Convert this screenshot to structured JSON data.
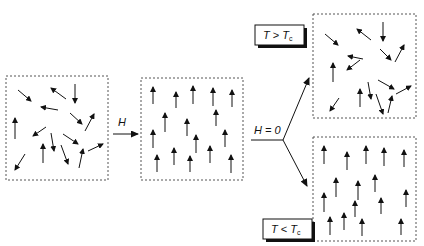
{
  "colors": {
    "ink": "#111111",
    "box_border": "#555555",
    "shadow": "#111111",
    "background": "#ffffff"
  },
  "labels": {
    "field_applied": "H",
    "field_removed": "H = 0",
    "high_temp": {
      "T": "T",
      "op": ">",
      "Tc": "T",
      "sub": "c"
    },
    "low_temp": {
      "T": "T",
      "op": "<",
      "Tc": "T",
      "sub": "c"
    }
  },
  "panels": [
    {
      "id": "random-initial",
      "state": "random",
      "box": [
        6,
        76,
        102,
        104
      ],
      "arrows": [
        [
          18,
          90,
          31,
          101
        ],
        [
          66,
          99,
          51,
          88
        ],
        [
          75,
          84,
          75,
          103
        ],
        [
          58,
          110,
          41,
          107
        ],
        [
          70,
          113,
          82,
          124
        ],
        [
          85,
          131,
          94,
          114
        ],
        [
          15,
          139,
          15,
          118
        ],
        [
          46,
          127,
          33,
          136
        ],
        [
          51,
          133,
          54,
          151
        ],
        [
          63,
          134,
          78,
          144
        ],
        [
          88,
          151,
          103,
          144
        ],
        [
          25,
          154,
          15,
          170
        ],
        [
          43,
          163,
          43,
          144
        ],
        [
          61,
          145,
          68,
          164
        ],
        [
          79,
          168,
          83,
          149
        ]
      ]
    },
    {
      "id": "aligned-field",
      "state": "aligned",
      "box": [
        141,
        78,
        102,
        102
      ],
      "arrows": [
        [
          153,
          104,
          153,
          87
        ],
        [
          176,
          108,
          176,
          92
        ],
        [
          193,
          104,
          193,
          86
        ],
        [
          213,
          106,
          213,
          88
        ],
        [
          232,
          107,
          232,
          90
        ],
        [
          165,
          132,
          165,
          113
        ],
        [
          216,
          126,
          216,
          110
        ],
        [
          187,
          136,
          187,
          119
        ],
        [
          153,
          148,
          153,
          130
        ],
        [
          196,
          153,
          196,
          135
        ],
        [
          225,
          147,
          225,
          130
        ],
        [
          174,
          165,
          174,
          148
        ],
        [
          157,
          172,
          157,
          155
        ],
        [
          190,
          172,
          190,
          156
        ],
        [
          210,
          163,
          210,
          146
        ],
        [
          231,
          173,
          231,
          155
        ]
      ]
    },
    {
      "id": "random-high-temp",
      "state": "random",
      "box": [
        313,
        14,
        103,
        104
      ],
      "arrows": [
        [
          325,
          34,
          338,
          45
        ],
        [
          371,
          40,
          357,
          29
        ],
        [
          383,
          22,
          383,
          41
        ],
        [
          363,
          59,
          348,
          56
        ],
        [
          380,
          49,
          391,
          60
        ],
        [
          395,
          62,
          404,
          45
        ],
        [
          333,
          82,
          333,
          63
        ],
        [
          360,
          60,
          347,
          70
        ],
        [
          368,
          82,
          371,
          99
        ],
        [
          378,
          80,
          394,
          89
        ],
        [
          396,
          94,
          411,
          86
        ],
        [
          339,
          98,
          330,
          111
        ],
        [
          360,
          107,
          360,
          89
        ],
        [
          376,
          94,
          383,
          114
        ],
        [
          388,
          113,
          392,
          96
        ]
      ]
    },
    {
      "id": "aligned-low-temp",
      "state": "aligned",
      "box": [
        313,
        137,
        103,
        104
      ],
      "arrows": [
        [
          324,
          164,
          324,
          146
        ],
        [
          347,
          170,
          347,
          152
        ],
        [
          366,
          164,
          366,
          146
        ],
        [
          384,
          166,
          384,
          148
        ],
        [
          404,
          167,
          404,
          150
        ],
        [
          336,
          197,
          336,
          178
        ],
        [
          375,
          192,
          375,
          175
        ],
        [
          358,
          200,
          358,
          181
        ],
        [
          324,
          212,
          324,
          193
        ],
        [
          355,
          217,
          355,
          201
        ],
        [
          406,
          207,
          406,
          190
        ],
        [
          344,
          230,
          344,
          213
        ],
        [
          381,
          214,
          381,
          198
        ],
        [
          330,
          235,
          330,
          217
        ],
        [
          362,
          236,
          362,
          219
        ],
        [
          401,
          235,
          401,
          219
        ]
      ]
    }
  ],
  "connectors": {
    "field_arrow": [
      113,
      134,
      138,
      134
    ],
    "h_label_pos": [
      118,
      126
    ],
    "branch_stem": [
      251,
      140,
      283,
      140
    ],
    "branch_up": [
      283,
      140,
      309,
      78
    ],
    "branch_down": [
      283,
      140,
      307,
      186
    ],
    "h0_label_pos": [
      254,
      134
    ]
  },
  "temp_boxes": {
    "high": [
      255,
      25,
      49,
      20
    ],
    "low": [
      263,
      219,
      49,
      20
    ]
  }
}
